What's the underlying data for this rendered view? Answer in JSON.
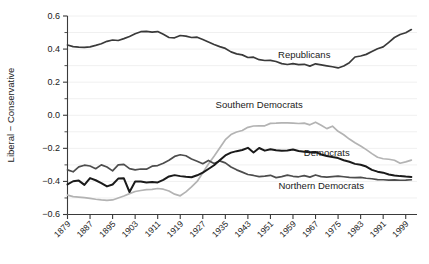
{
  "chart_data": {
    "type": "line",
    "title": "",
    "subtitle": "",
    "xlabel": "",
    "ylabel": "Liberal − Conservative",
    "xlim": [
      1879,
      2003
    ],
    "ylim": [
      -0.6,
      0.6
    ],
    "grid": true,
    "grid_axis": "y",
    "legend": "inline-annotations",
    "x_tick_labels": [
      "1879",
      "1887",
      "1895",
      "1903",
      "1911",
      "1919",
      "1927",
      "1935",
      "1943",
      "1951",
      "1959",
      "1967",
      "1975",
      "1983",
      "1991",
      "1999"
    ],
    "x_tick_values": [
      1879,
      1887,
      1895,
      1903,
      1911,
      1919,
      1927,
      1935,
      1943,
      1951,
      1959,
      1967,
      1975,
      1983,
      1991,
      1999
    ],
    "y_tick_labels": [
      "0.6",
      "0.4",
      "0.2",
      "0.0",
      "−0.2",
      "−0.4",
      "−0.6"
    ],
    "y_tick_values": [
      0.6,
      0.4,
      0.2,
      0.0,
      -0.2,
      -0.4,
      -0.6
    ],
    "y_minor_tick_values": [
      0.5,
      0.3,
      0.1,
      -0.1,
      -0.3,
      -0.5
    ],
    "x": [
      1879,
      1881,
      1883,
      1885,
      1887,
      1889,
      1891,
      1893,
      1895,
      1897,
      1899,
      1901,
      1903,
      1905,
      1907,
      1909,
      1911,
      1913,
      1915,
      1917,
      1919,
      1921,
      1923,
      1925,
      1927,
      1929,
      1931,
      1933,
      1935,
      1937,
      1939,
      1941,
      1943,
      1945,
      1947,
      1949,
      1951,
      1953,
      1955,
      1957,
      1959,
      1961,
      1963,
      1965,
      1967,
      1969,
      1971,
      1973,
      1975,
      1977,
      1979,
      1981,
      1983,
      1985,
      1987,
      1989,
      1991,
      1993,
      1995,
      1997,
      1999,
      2001
    ],
    "series": [
      {
        "name": "Republicans",
        "color": "#3a3a3a",
        "width": 1.7,
        "label_x": 1963,
        "label_y": 0.345,
        "values": [
          0.425,
          0.415,
          0.412,
          0.41,
          0.413,
          0.422,
          0.432,
          0.447,
          0.455,
          0.452,
          0.463,
          0.476,
          0.493,
          0.505,
          0.507,
          0.503,
          0.506,
          0.489,
          0.47,
          0.468,
          0.482,
          0.478,
          0.47,
          0.472,
          0.458,
          0.443,
          0.428,
          0.415,
          0.404,
          0.383,
          0.371,
          0.365,
          0.349,
          0.351,
          0.336,
          0.331,
          0.332,
          0.325,
          0.312,
          0.307,
          0.312,
          0.306,
          0.308,
          0.297,
          0.311,
          0.305,
          0.299,
          0.293,
          0.286,
          0.298,
          0.318,
          0.352,
          0.358,
          0.368,
          0.385,
          0.402,
          0.413,
          0.441,
          0.47,
          0.488,
          0.499,
          0.518
        ]
      },
      {
        "name": "Southern Democrats",
        "color": "#b3b3b3",
        "width": 1.7,
        "label_x": 1947,
        "label_y": 0.045,
        "values": [
          -0.483,
          -0.492,
          -0.495,
          -0.498,
          -0.503,
          -0.508,
          -0.512,
          -0.515,
          -0.512,
          -0.5,
          -0.488,
          -0.474,
          -0.461,
          -0.455,
          -0.45,
          -0.448,
          -0.443,
          -0.447,
          -0.458,
          -0.477,
          -0.487,
          -0.463,
          -0.433,
          -0.4,
          -0.348,
          -0.295,
          -0.248,
          -0.198,
          -0.148,
          -0.117,
          -0.101,
          -0.092,
          -0.073,
          -0.065,
          -0.064,
          -0.064,
          -0.049,
          -0.048,
          -0.046,
          -0.046,
          -0.048,
          -0.05,
          -0.048,
          -0.058,
          -0.042,
          -0.06,
          -0.081,
          -0.066,
          -0.097,
          -0.118,
          -0.144,
          -0.166,
          -0.186,
          -0.208,
          -0.232,
          -0.254,
          -0.263,
          -0.266,
          -0.272,
          -0.29,
          -0.282,
          -0.271
        ]
      },
      {
        "name": "Democrats",
        "color": "#1a1a1a",
        "width": 2.0,
        "label_x": 1971,
        "label_y": -0.247,
        "values": [
          -0.418,
          -0.399,
          -0.395,
          -0.421,
          -0.38,
          -0.393,
          -0.41,
          -0.43,
          -0.419,
          -0.383,
          -0.381,
          -0.464,
          -0.4,
          -0.401,
          -0.406,
          -0.404,
          -0.406,
          -0.391,
          -0.37,
          -0.362,
          -0.368,
          -0.372,
          -0.375,
          -0.363,
          -0.347,
          -0.325,
          -0.302,
          -0.272,
          -0.243,
          -0.226,
          -0.217,
          -0.21,
          -0.197,
          -0.225,
          -0.198,
          -0.214,
          -0.205,
          -0.212,
          -0.215,
          -0.213,
          -0.207,
          -0.216,
          -0.221,
          -0.224,
          -0.222,
          -0.237,
          -0.246,
          -0.253,
          -0.259,
          -0.272,
          -0.281,
          -0.294,
          -0.299,
          -0.31,
          -0.33,
          -0.341,
          -0.347,
          -0.358,
          -0.364,
          -0.368,
          -0.371,
          -0.373
        ]
      },
      {
        "name": "Northern Democrats",
        "color": "#4d4d4d",
        "width": 1.7,
        "label_x": 1969,
        "label_y": -0.448,
        "values": [
          -0.33,
          -0.342,
          -0.312,
          -0.302,
          -0.307,
          -0.323,
          -0.3,
          -0.313,
          -0.336,
          -0.3,
          -0.297,
          -0.323,
          -0.33,
          -0.325,
          -0.326,
          -0.308,
          -0.304,
          -0.29,
          -0.272,
          -0.249,
          -0.239,
          -0.245,
          -0.264,
          -0.278,
          -0.293,
          -0.273,
          -0.292,
          -0.276,
          -0.288,
          -0.313,
          -0.33,
          -0.344,
          -0.358,
          -0.364,
          -0.371,
          -0.368,
          -0.363,
          -0.377,
          -0.371,
          -0.362,
          -0.369,
          -0.372,
          -0.365,
          -0.374,
          -0.361,
          -0.371,
          -0.374,
          -0.371,
          -0.368,
          -0.372,
          -0.376,
          -0.377,
          -0.376,
          -0.381,
          -0.384,
          -0.389,
          -0.39,
          -0.392,
          -0.391,
          -0.393,
          -0.392,
          -0.39
        ]
      }
    ]
  }
}
